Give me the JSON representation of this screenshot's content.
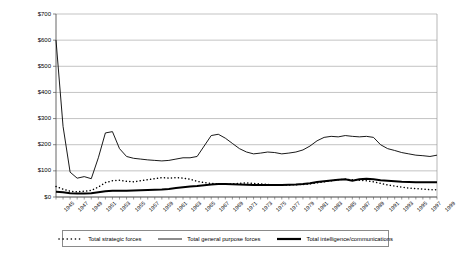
{
  "chart_data": {
    "type": "line",
    "title": "",
    "xlabel": "",
    "ylabel": "Constant 1982 dollars (in billions)",
    "ylim": [
      0,
      700
    ],
    "xlim": [
      1945,
      1999
    ],
    "grid": true,
    "legend_position": "bottom",
    "ytick_labels": [
      "$0",
      "$100",
      "$200",
      "$300",
      "$400",
      "$500",
      "$600",
      "$700"
    ],
    "ytick_values": [
      0,
      100,
      200,
      300,
      400,
      500,
      600,
      700
    ],
    "xtick_labels": [
      "1945",
      "1947",
      "1949",
      "1951",
      "1953",
      "1955",
      "1957",
      "1959",
      "1961",
      "1963",
      "1965",
      "1967",
      "1969",
      "1971",
      "1973",
      "1975",
      "1977",
      "1979",
      "1981",
      "1983",
      "1985",
      "1987",
      "1989",
      "1991",
      "1993",
      "1995",
      "1997",
      "1999"
    ],
    "x": [
      1945,
      1946,
      1947,
      1948,
      1949,
      1950,
      1951,
      1952,
      1953,
      1954,
      1955,
      1956,
      1957,
      1958,
      1959,
      1960,
      1961,
      1962,
      1963,
      1964,
      1965,
      1966,
      1967,
      1968,
      1969,
      1970,
      1971,
      1972,
      1973,
      1974,
      1975,
      1976,
      1977,
      1978,
      1979,
      1980,
      1981,
      1982,
      1983,
      1984,
      1985,
      1986,
      1987,
      1988,
      1989,
      1990,
      1991,
      1992,
      1993,
      1994,
      1995,
      1996,
      1997,
      1998,
      1999
    ],
    "series": [
      {
        "name": "Total strategic forces",
        "style": "dotted",
        "values": [
          40,
          30,
          22,
          20,
          22,
          25,
          38,
          55,
          62,
          64,
          60,
          58,
          62,
          66,
          70,
          74,
          72,
          74,
          72,
          68,
          60,
          55,
          52,
          50,
          48,
          50,
          52,
          54,
          52,
          50,
          48,
          46,
          45,
          46,
          47,
          48,
          50,
          54,
          58,
          62,
          66,
          68,
          66,
          64,
          62,
          58,
          52,
          46,
          42,
          38,
          34,
          32,
          30,
          28,
          28
        ]
      },
      {
        "name": "Total general purpose forces",
        "style": "solid-thin",
        "values": [
          600,
          270,
          95,
          72,
          78,
          70,
          150,
          245,
          250,
          185,
          155,
          148,
          145,
          142,
          140,
          138,
          140,
          145,
          150,
          150,
          155,
          195,
          235,
          240,
          225,
          205,
          185,
          172,
          165,
          168,
          172,
          170,
          165,
          168,
          172,
          180,
          195,
          215,
          228,
          232,
          230,
          235,
          232,
          230,
          232,
          228,
          200,
          185,
          178,
          170,
          165,
          160,
          158,
          155,
          160
        ]
      },
      {
        "name": "Total intelligence/communications",
        "style": "solid-thick",
        "values": [
          20,
          18,
          14,
          13,
          13,
          14,
          18,
          22,
          24,
          24,
          24,
          25,
          26,
          27,
          28,
          29,
          31,
          34,
          37,
          40,
          42,
          45,
          48,
          50,
          50,
          49,
          48,
          47,
          46,
          46,
          46,
          46,
          46,
          47,
          48,
          50,
          53,
          57,
          60,
          63,
          66,
          68,
          62,
          68,
          70,
          68,
          64,
          62,
          60,
          58,
          57,
          56,
          56,
          56,
          56
        ]
      }
    ]
  }
}
